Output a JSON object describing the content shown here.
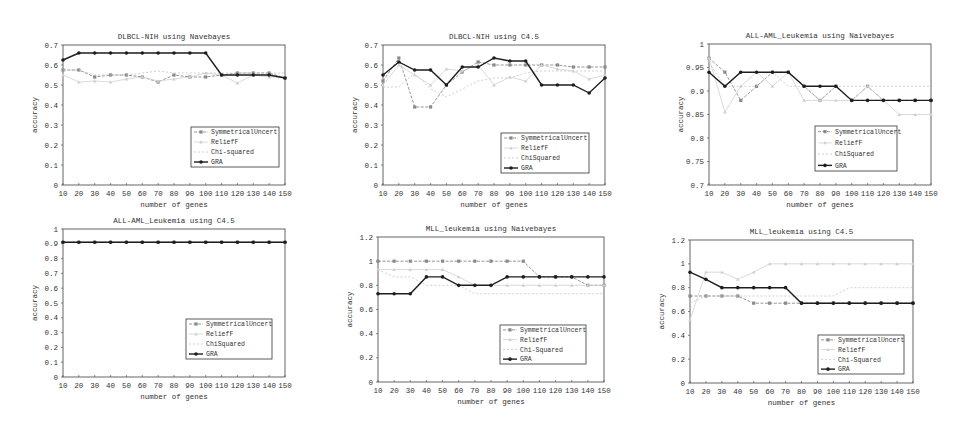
{
  "x_axis": {
    "label": "number of genes",
    "ticks": [
      "10",
      "20",
      "30",
      "40",
      "50",
      "60",
      "70",
      "80",
      "90",
      "100",
      "110",
      "120",
      "130",
      "140",
      "150"
    ]
  },
  "series_names": [
    "SymmetricalUncert",
    "ReliefF",
    "Chi-squared",
    "GRA"
  ],
  "colors": {
    "SymmetricalUncert": "#888888",
    "ReliefF": "#cccccc",
    "ChiSquared": "#c8c8c8",
    "GRA": "#222222",
    "frame": "#444444"
  },
  "chart_data": [
    {
      "type": "line",
      "title": "DLBCL-NIH using Navebayes",
      "xlabel": "number of genes",
      "ylabel": "accuracy",
      "x": [
        10,
        20,
        30,
        40,
        50,
        60,
        70,
        80,
        90,
        100,
        110,
        120,
        130,
        140,
        150
      ],
      "ylim": [
        0,
        0.7
      ],
      "yticks": [
        "0",
        "0.1",
        "0.2",
        "0.3",
        "0.4",
        "0.5",
        "0.6",
        "0.7"
      ],
      "legend": [
        "SymmetricalUncert",
        "ReliefF",
        "Chi-squared",
        "GRA"
      ],
      "series": [
        {
          "name": "SymmetricalUncert",
          "values": [
            0.575,
            0.575,
            0.54,
            0.55,
            0.55,
            0.54,
            0.515,
            0.55,
            0.54,
            0.54,
            0.55,
            0.56,
            0.56,
            0.56,
            0.535
          ]
        },
        {
          "name": "ReliefF",
          "values": [
            0.55,
            0.515,
            0.52,
            0.515,
            0.53,
            0.54,
            0.52,
            0.53,
            0.54,
            0.56,
            0.55,
            0.51,
            0.55,
            0.54,
            0.54
          ]
        },
        {
          "name": "Chi-squared",
          "values": [
            0.575,
            0.575,
            0.55,
            0.55,
            0.55,
            0.56,
            0.57,
            0.56,
            0.56,
            0.56,
            0.56,
            0.56,
            0.56,
            0.56,
            0.56
          ]
        },
        {
          "name": "GRA",
          "values": [
            0.625,
            0.66,
            0.66,
            0.66,
            0.66,
            0.66,
            0.66,
            0.66,
            0.66,
            0.66,
            0.55,
            0.55,
            0.55,
            0.55,
            0.535
          ]
        }
      ]
    },
    {
      "type": "line",
      "title": "DLBCL-NIH using C4.5",
      "xlabel": "number of genes",
      "ylabel": "accuracy",
      "x": [
        10,
        20,
        30,
        40,
        50,
        60,
        70,
        80,
        90,
        100,
        110,
        120,
        130,
        140,
        150
      ],
      "ylim": [
        0,
        0.7
      ],
      "yticks": [
        "0",
        "0.1",
        "0.2",
        "0.3",
        "0.4",
        "0.5",
        "0.6",
        "0.7"
      ],
      "legend": [
        "SymmetricalUncert",
        "ReliefF",
        "ChiSquared",
        "GRA"
      ],
      "series": [
        {
          "name": "SymmetricalUncert",
          "values": [
            0.52,
            0.635,
            0.39,
            0.39,
            0.5,
            0.565,
            0.615,
            0.6,
            0.6,
            0.6,
            0.6,
            0.6,
            0.59,
            0.59,
            0.59
          ]
        },
        {
          "name": "ReliefF",
          "values": [
            0.5,
            0.6,
            0.55,
            0.5,
            0.58,
            0.57,
            0.6,
            0.5,
            0.54,
            0.52,
            0.6,
            0.58,
            0.57,
            0.53,
            0.55
          ]
        },
        {
          "name": "ChiSquared",
          "values": [
            0.49,
            0.49,
            0.56,
            0.48,
            0.44,
            0.48,
            0.52,
            0.535,
            0.535,
            0.56,
            0.57,
            0.57,
            0.57,
            0.57,
            0.57
          ]
        },
        {
          "name": "GRA",
          "values": [
            0.55,
            0.615,
            0.575,
            0.575,
            0.5,
            0.59,
            0.59,
            0.635,
            0.62,
            0.62,
            0.5,
            0.5,
            0.5,
            0.46,
            0.535
          ]
        }
      ]
    },
    {
      "type": "line",
      "title": "ALL-AML_Leukemia using Naivebayes",
      "xlabel": "number of genes",
      "ylabel": "accuracy",
      "x": [
        10,
        20,
        30,
        40,
        50,
        60,
        70,
        80,
        90,
        100,
        110,
        120,
        130,
        140,
        150
      ],
      "ylim": [
        0.7,
        1.0
      ],
      "yticks": [
        "0.7",
        "0.75",
        "0.8",
        "0.85",
        "0.9",
        "0.95",
        "1"
      ],
      "legend": [
        "SymmetricalUncert",
        "ReliefF",
        "ChiSquared",
        "GRA"
      ],
      "series": [
        {
          "name": "SymmetricalUncert",
          "values": [
            0.97,
            0.94,
            0.88,
            0.91,
            0.94,
            0.94,
            0.91,
            0.88,
            0.91,
            0.88,
            0.91,
            0.88,
            0.88,
            0.88,
            0.88
          ]
        },
        {
          "name": "ReliefF",
          "values": [
            0.97,
            0.855,
            0.91,
            0.94,
            0.91,
            0.94,
            0.88,
            0.88,
            0.88,
            0.88,
            0.91,
            0.88,
            0.85,
            0.85,
            0.85
          ]
        },
        {
          "name": "ChiSquared",
          "values": [
            0.96,
            0.91,
            0.91,
            0.91,
            0.94,
            0.91,
            0.91,
            0.88,
            0.91,
            0.91,
            0.91,
            0.91,
            0.91,
            0.91,
            0.91
          ]
        },
        {
          "name": "GRA",
          "values": [
            0.94,
            0.91,
            0.94,
            0.94,
            0.94,
            0.94,
            0.91,
            0.91,
            0.91,
            0.88,
            0.88,
            0.88,
            0.88,
            0.88,
            0.88
          ]
        }
      ]
    },
    {
      "type": "line",
      "title": "ALL-AML_Leukemia using C4.5",
      "xlabel": "number of genes",
      "ylabel": "accuracy",
      "x": [
        10,
        20,
        30,
        40,
        50,
        60,
        70,
        80,
        90,
        100,
        110,
        120,
        130,
        140,
        150
      ],
      "ylim": [
        0,
        1.0
      ],
      "yticks": [
        "0",
        "0.1",
        "0.2",
        "0.3",
        "0.4",
        "0.5",
        "0.6",
        "0.7",
        "0.8",
        "0.9",
        "1"
      ],
      "legend": [
        "SymmetricalUncert",
        "ReliefF",
        "ChiSquared",
        "GRA"
      ],
      "series": [
        {
          "name": "SymmetricalUncert",
          "values": [
            0.91,
            0.91,
            0.91,
            0.91,
            0.91,
            0.91,
            0.91,
            0.91,
            0.91,
            0.91,
            0.91,
            0.91,
            0.91,
            0.91,
            0.91
          ]
        },
        {
          "name": "ReliefF",
          "values": [
            0.91,
            0.91,
            0.91,
            0.91,
            0.91,
            0.91,
            0.91,
            0.91,
            0.91,
            0.91,
            0.91,
            0.91,
            0.91,
            0.91,
            0.91
          ]
        },
        {
          "name": "ChiSquared",
          "values": [
            0.91,
            0.91,
            0.91,
            0.91,
            0.91,
            0.91,
            0.91,
            0.91,
            0.91,
            0.91,
            0.91,
            0.91,
            0.91,
            0.91,
            0.91
          ]
        },
        {
          "name": "GRA",
          "values": [
            0.91,
            0.91,
            0.91,
            0.91,
            0.91,
            0.91,
            0.91,
            0.91,
            0.91,
            0.91,
            0.91,
            0.91,
            0.91,
            0.91,
            0.91
          ]
        }
      ]
    },
    {
      "type": "line",
      "title": "MLL_leukemia using Naivebayes",
      "xlabel": "number of genes",
      "ylabel": "accuracy",
      "x": [
        10,
        20,
        30,
        40,
        50,
        60,
        70,
        80,
        90,
        100,
        110,
        120,
        130,
        140,
        150
      ],
      "ylim": [
        0,
        1.2
      ],
      "yticks": [
        "0",
        "0.2",
        "0.4",
        "0.6",
        "0.8",
        "1",
        "1.2"
      ],
      "legend": [
        "SymmetricalUncert",
        "ReliefF",
        "Chi-Squared",
        "GRA"
      ],
      "series": [
        {
          "name": "SymmetricalUncert",
          "values": [
            1.0,
            1.0,
            1.0,
            1.0,
            1.0,
            1.0,
            1.0,
            1.0,
            1.0,
            1.0,
            0.87,
            0.87,
            0.87,
            0.8,
            0.8
          ]
        },
        {
          "name": "ReliefF",
          "values": [
            0.93,
            0.93,
            0.93,
            0.93,
            0.93,
            0.87,
            0.8,
            0.8,
            0.8,
            0.8,
            0.8,
            0.8,
            0.8,
            0.8,
            0.8
          ]
        },
        {
          "name": "Chi-Squared",
          "values": [
            0.93,
            0.87,
            0.87,
            0.8,
            0.8,
            0.8,
            0.73,
            0.73,
            0.73,
            0.73,
            0.73,
            0.73,
            0.73,
            0.73,
            0.73
          ]
        },
        {
          "name": "GRA",
          "values": [
            0.73,
            0.73,
            0.73,
            0.87,
            0.87,
            0.8,
            0.8,
            0.8,
            0.87,
            0.87,
            0.87,
            0.87,
            0.87,
            0.87,
            0.87
          ]
        }
      ]
    },
    {
      "type": "line",
      "title": "MLL_leukemia using C4.5",
      "xlabel": "number of genes",
      "ylabel": "accuracy",
      "x": [
        10,
        20,
        30,
        40,
        50,
        60,
        70,
        80,
        90,
        100,
        110,
        120,
        130,
        140,
        150
      ],
      "ylim": [
        0,
        1.2
      ],
      "yticks": [
        "0",
        "0.2",
        "0.4",
        "0.6",
        "0.8",
        "1",
        "1.2"
      ],
      "legend": [
        "SymmetricalUncert",
        "ReliefF",
        "Chi-Squared",
        "GRA"
      ],
      "series": [
        {
          "name": "SymmetricalUncert",
          "values": [
            0.73,
            0.73,
            0.73,
            0.73,
            0.67,
            0.67,
            0.67,
            0.67,
            0.67,
            0.67,
            0.67,
            0.67,
            0.67,
            0.67,
            0.67
          ]
        },
        {
          "name": "ReliefF",
          "values": [
            0.53,
            0.93,
            0.93,
            0.87,
            0.93,
            1.0,
            1.0,
            1.0,
            1.0,
            1.0,
            1.0,
            1.0,
            1.0,
            1.0,
            1.0
          ]
        },
        {
          "name": "Chi-Squared",
          "values": [
            0.67,
            0.73,
            0.73,
            0.73,
            0.73,
            0.73,
            0.73,
            0.73,
            0.73,
            0.73,
            0.8,
            0.8,
            0.8,
            0.8,
            0.8
          ]
        },
        {
          "name": "GRA",
          "values": [
            0.93,
            0.87,
            0.8,
            0.8,
            0.8,
            0.8,
            0.8,
            0.67,
            0.67,
            0.67,
            0.67,
            0.67,
            0.67,
            0.67,
            0.67
          ]
        }
      ]
    }
  ],
  "layout": [
    {
      "left": 0,
      "top": 0,
      "plot": {
        "x": 63,
        "y": 45,
        "w": 222,
        "h": 140
      },
      "legend": {
        "x": 191,
        "y": 127,
        "w": 88,
        "h": 40
      }
    },
    {
      "left": 0,
      "top": 0,
      "plot": {
        "x": 383,
        "y": 45,
        "w": 222,
        "h": 140
      },
      "legend": {
        "x": 501,
        "y": 133,
        "w": 88,
        "h": 40
      }
    },
    {
      "left": 0,
      "top": 0,
      "plot": {
        "x": 709,
        "y": 44,
        "w": 222,
        "h": 141
      },
      "legend": {
        "x": 815,
        "y": 126,
        "w": 82,
        "h": 45
      }
    },
    {
      "left": 0,
      "top": 0,
      "plot": {
        "x": 63,
        "y": 229,
        "w": 222,
        "h": 148
      },
      "legend": {
        "x": 186,
        "y": 319,
        "w": 86,
        "h": 40
      }
    },
    {
      "left": 0,
      "top": 0,
      "plot": {
        "x": 378,
        "y": 237,
        "w": 226,
        "h": 145
      },
      "legend": {
        "x": 500,
        "y": 325,
        "w": 86,
        "h": 39
      }
    },
    {
      "left": 0,
      "top": 0,
      "plot": {
        "x": 690,
        "y": 240,
        "w": 223,
        "h": 143
      },
      "legend": {
        "x": 818,
        "y": 335,
        "w": 86,
        "h": 39
      }
    }
  ]
}
